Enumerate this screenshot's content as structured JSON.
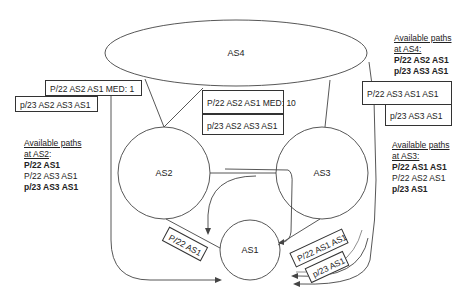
{
  "nodes": {
    "as4": "AS4",
    "as2": "AS2",
    "as3": "AS3",
    "as1": "AS1"
  },
  "messages": {
    "as4_to_as2_top": "P/22 AS2 AS1 MED: 1",
    "as4_to_as2_bottom": "p/23 AS2 AS3 AS1",
    "as4_to_as3_top": "P/22 AS2 AS1 MED: 10",
    "as4_to_as3_bottom": "p/23 AS2 AS3 AS1",
    "right_top": "P/22 AS3 AS1 AS1",
    "right_bottom": "p/23 AS3 AS1",
    "as1_to_as2": "P/22 AS1",
    "as1_to_as3_top": "P/22 AS1 AS1",
    "as1_to_as3_bottom": "p/23 AS1"
  },
  "available_paths": {
    "as4": {
      "title1": "Available paths",
      "title2": "at AS4:",
      "paths": [
        {
          "text": "P/22 AS2 AS1",
          "bold": true
        },
        {
          "text": "p/23 AS3 AS1",
          "bold": true
        }
      ]
    },
    "as2": {
      "title1": "Available paths",
      "title2": "at AS2",
      "title_suffix": ":",
      "paths": [
        {
          "text": "P/22 AS1",
          "bold": true
        },
        {
          "text": "P/22 AS3 AS1",
          "bold": false
        },
        {
          "text": "p/23 AS3 AS1",
          "bold": true
        }
      ]
    },
    "as3": {
      "title1": "Available paths",
      "title2": "at AS3:",
      "paths": [
        {
          "text": "P/22 AS1 AS1",
          "bold": true
        },
        {
          "text": "P/22 AS2 AS1",
          "bold": false
        },
        {
          "text": "p/23 AS1",
          "bold": true
        }
      ]
    }
  }
}
